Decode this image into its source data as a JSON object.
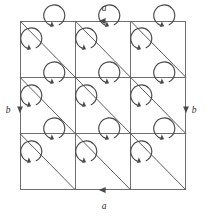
{
  "figure": {
    "background_color": "#ffffff",
    "line_color": "#6e6e6e",
    "diagonal_color": "#5c5c5c",
    "arrow_color": "#4a4a4a",
    "label_color": "#2e2e2e",
    "grid": {
      "rows": 3,
      "cols": 3,
      "x0": 20,
      "y0": 21,
      "cell_w": 55.3,
      "cell_h": 56.3,
      "diagonal_direction": "top-left-to-bottom-right"
    },
    "arrow_style": {
      "shape": "circular-arc",
      "rotation": "counterclockwise",
      "radius": 10.5,
      "gap_position": "upper-left",
      "arrowhead_direction": "up"
    }
  },
  "edge_labels": [
    {
      "name": "top-edge-label",
      "text": "a",
      "x": 104,
      "y": 11,
      "marker": "left-arrowhead",
      "marker_x": 103,
      "marker_y": 21
    },
    {
      "name": "bottom-edge-label",
      "text": "a",
      "x": 104,
      "y": 209,
      "marker": "left-arrowhead",
      "marker_x": 103,
      "marker_y": 190
    },
    {
      "name": "left-edge-label",
      "text": "b",
      "x": 8,
      "y": 110,
      "marker": "down-arrowhead",
      "marker_x": 20,
      "marker_y": 109
    },
    {
      "name": "right-edge-label",
      "text": "b",
      "x": 194,
      "y": 110,
      "marker": "down-arrowhead",
      "marker_x": 186,
      "marker_y": 109
    }
  ],
  "cell_arrows": [
    {
      "cell": "r0c0-upper",
      "cx": 57,
      "cy": 35
    },
    {
      "cell": "r0c0-lower",
      "cx": 34,
      "cy": 58
    },
    {
      "cell": "r0c1-upper",
      "cx": 112,
      "cy": 35
    },
    {
      "cell": "r0c1-lower",
      "cx": 89,
      "cy": 58
    },
    {
      "cell": "r0c2-upper",
      "cx": 167,
      "cy": 35
    },
    {
      "cell": "r0c2-lower",
      "cx": 144,
      "cy": 58
    },
    {
      "cell": "r1c0-upper",
      "cx": 57,
      "cy": 92
    },
    {
      "cell": "r1c0-lower",
      "cx": 34,
      "cy": 115
    },
    {
      "cell": "r1c1-upper",
      "cx": 112,
      "cy": 92
    },
    {
      "cell": "r1c1-lower",
      "cx": 89,
      "cy": 115
    },
    {
      "cell": "r1c2-upper",
      "cx": 167,
      "cy": 92
    },
    {
      "cell": "r1c2-lower",
      "cx": 144,
      "cy": 115
    },
    {
      "cell": "r2c0-upper",
      "cx": 57,
      "cy": 148
    },
    {
      "cell": "r2c0-lower",
      "cx": 34,
      "cy": 171
    },
    {
      "cell": "r2c1-upper",
      "cx": 112,
      "cy": 148
    },
    {
      "cell": "r2c1-lower",
      "cx": 89,
      "cy": 171
    },
    {
      "cell": "r2c2-upper",
      "cx": 167,
      "cy": 148
    },
    {
      "cell": "r2c2-lower",
      "cx": 144,
      "cy": 171
    }
  ]
}
